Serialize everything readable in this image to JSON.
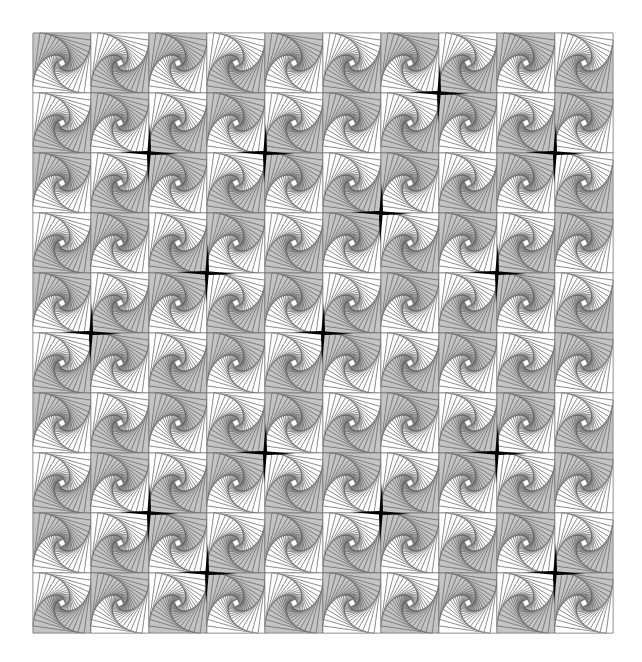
{
  "artwork": {
    "title": "Spiral nested-square tiling",
    "canvas": {
      "width": 642,
      "height": 662,
      "background": "#ffffff"
    },
    "grid": {
      "x0": 33,
      "y0": 33,
      "cols": 10,
      "rows": 10,
      "tile_w": 58,
      "tile_h": 60
    },
    "tile": {
      "nested_squares": 20,
      "step_fraction": 0.12,
      "line_color": "#555555",
      "line_width": 0.5,
      "gray_fill": "#c4c4c4",
      "white_fill": "#ffffff",
      "border_color": "#8a8a8a"
    },
    "tile_pattern": {
      "rule": "checkerboard",
      "type_even": "A",
      "type_odd": "B",
      "types": {
        "A": {
          "description": "gray arms top and left, white lower-right",
          "gray_arms": [
            0,
            3
          ]
        },
        "B": {
          "description": "gray arms bottom and right, white upper-left",
          "gray_arms": [
            1,
            2
          ]
        }
      }
    },
    "stars": {
      "color": "#000000",
      "arm_length": 30,
      "arm_width": 4,
      "positions": [
        {
          "i": 7,
          "j": 1
        },
        {
          "i": 2,
          "j": 2
        },
        {
          "i": 4,
          "j": 2
        },
        {
          "i": 9,
          "j": 2
        },
        {
          "i": 6,
          "j": 3
        },
        {
          "i": 3,
          "j": 4
        },
        {
          "i": 8,
          "j": 4
        },
        {
          "i": 1,
          "j": 5
        },
        {
          "i": 5,
          "j": 5
        },
        {
          "i": 4,
          "j": 7
        },
        {
          "i": 8,
          "j": 7
        },
        {
          "i": 2,
          "j": 8
        },
        {
          "i": 6,
          "j": 8
        },
        {
          "i": 3,
          "j": 9
        },
        {
          "i": 9,
          "j": 9
        }
      ]
    }
  }
}
